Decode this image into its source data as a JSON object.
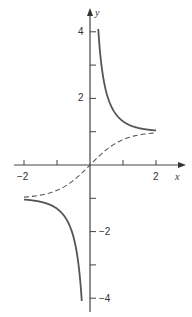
{
  "chart_data": {
    "type": "line",
    "title": "",
    "xlabel": "x",
    "ylabel": "y",
    "xlim": [
      -2,
      2
    ],
    "ylim": [
      -4,
      4
    ],
    "grid": false,
    "legend": null,
    "x_ticks": [
      -2,
      -1,
      1,
      2
    ],
    "x_tick_labels": [
      "-2",
      "",
      "",
      "2"
    ],
    "y_ticks": [
      4,
      3,
      2,
      1,
      -1,
      -2,
      -3,
      -4
    ],
    "y_tick_labels": [
      "4",
      "",
      "2",
      "",
      "",
      "-2",
      "",
      "-4"
    ],
    "series": [
      {
        "name": "coth x",
        "style": "solid",
        "branches": [
          {
            "x": [
              0.25,
              0.3,
              0.4,
              0.5,
              0.75,
              1.0,
              1.25,
              1.5,
              1.75,
              2.0
            ],
            "y": [
              4.08,
              3.43,
              2.63,
              2.16,
              1.57,
              1.31,
              1.18,
              1.1,
              1.06,
              1.04
            ]
          },
          {
            "x": [
              -2.0,
              -1.75,
              -1.5,
              -1.25,
              -1.0,
              -0.75,
              -0.5,
              -0.4,
              -0.3,
              -0.25
            ],
            "y": [
              -1.04,
              -1.06,
              -1.1,
              -1.18,
              -1.31,
              -1.57,
              -2.16,
              -2.63,
              -3.43,
              -4.08
            ]
          }
        ]
      },
      {
        "name": "tanh x",
        "style": "dashed",
        "x": [
          -2.0,
          -1.5,
          -1.0,
          -0.5,
          0,
          0.5,
          1.0,
          1.5,
          2.0
        ],
        "y": [
          -0.96,
          -0.91,
          -0.76,
          -0.46,
          0,
          0.46,
          0.76,
          0.91,
          0.96
        ]
      }
    ]
  },
  "colors": {
    "curve": "#555555",
    "axis": "#444444"
  },
  "labels": {
    "x_axis": "x",
    "y_axis": "y",
    "x_neg2": "−2",
    "x_pos2": "2",
    "y_pos4": "4",
    "y_pos2": "2",
    "y_neg2": "−2",
    "y_neg4": "−4"
  }
}
